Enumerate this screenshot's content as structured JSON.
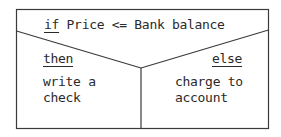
{
  "diagram": {
    "type": "nassi-shneiderman-decision",
    "condition": {
      "keyword": "if",
      "expression": " Price <= Bank balance"
    },
    "then_branch": {
      "label": "then",
      "action_line1": "write a",
      "action_line2": "check"
    },
    "else_branch": {
      "label": "else",
      "action_line1": "charge to",
      "action_line2": "account"
    },
    "colors": {
      "line": "#3a3a3a",
      "text": "#2a2a2a",
      "background": "#ffffff"
    }
  }
}
